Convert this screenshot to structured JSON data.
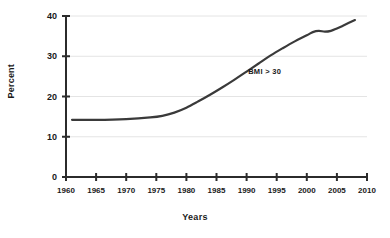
{
  "chart_data": {
    "type": "line",
    "title": "",
    "xlabel": "Years",
    "ylabel": "Percent",
    "xlim": [
      1960,
      2010
    ],
    "ylim": [
      0,
      40
    ],
    "grid": true,
    "legend": "none",
    "xticks": [
      "1960",
      "1965",
      "1970",
      "1975",
      "1980",
      "1985",
      "1990",
      "1995",
      "2000",
      "2005",
      "2010"
    ],
    "xtick_values": [
      1960,
      1965,
      1970,
      1975,
      1980,
      1985,
      1990,
      1995,
      2000,
      2005,
      2010
    ],
    "yticks": [
      "0",
      "10",
      "20",
      "30",
      "40"
    ],
    "ytick_values": [
      0,
      10,
      20,
      30,
      40
    ],
    "annotations": [
      {
        "text": "BMI > 30",
        "x": 1993,
        "y": 25.5
      }
    ],
    "series": [
      {
        "name": "BMI > 30",
        "color": "#3a3a3a",
        "x": [
          1961,
          1965,
          1970,
          1974,
          1976,
          1978,
          1980,
          1982,
          1984,
          1986,
          1988,
          1990,
          1992,
          1994,
          1996,
          1998,
          2000,
          2001,
          2002,
          2003,
          2004,
          2005,
          2006,
          2007,
          2008
        ],
        "values": [
          14.2,
          14.2,
          14.4,
          14.8,
          15.2,
          16.0,
          17.2,
          18.8,
          20.5,
          22.3,
          24.2,
          26.2,
          28.2,
          30.2,
          32.0,
          33.7,
          35.2,
          36.0,
          36.3,
          36.1,
          36.3,
          36.9,
          37.6,
          38.3,
          39.0
        ]
      }
    ]
  },
  "axis": {
    "ylabel_text": "Percent",
    "xlabel_text": "Years"
  },
  "colors": {
    "line": "#3a3a3a",
    "grid": "#e4e4e4",
    "axis": "#2b2b2b",
    "background": "#ffffff",
    "text": "#1a1a1a"
  }
}
